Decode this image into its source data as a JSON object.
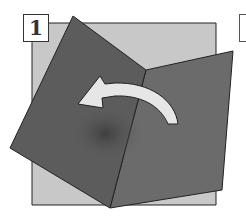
{
  "step": {
    "number": "1"
  },
  "colors": {
    "paper_back": "#c8c8c8",
    "paper_front": "#5e5e5e",
    "paper_front_right": "#6b6b6b",
    "arrow": "#e6e6e6",
    "outline": "#222222"
  },
  "illustration": {
    "description": "Paper folding step: dark folded panels over light square with curved arrow pointing left",
    "arrow_direction": "left"
  }
}
